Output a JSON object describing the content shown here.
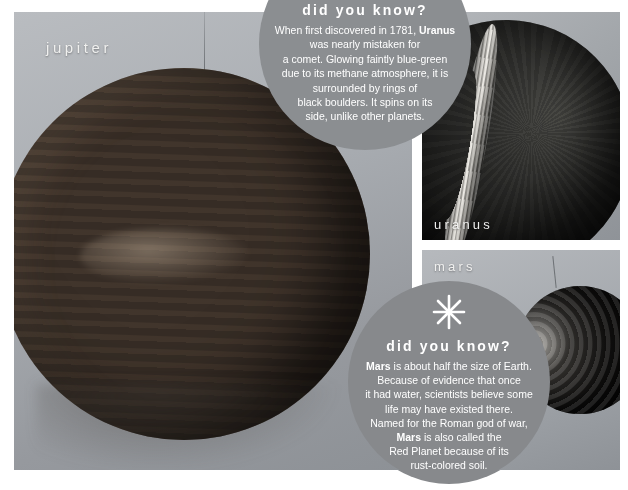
{
  "page": {
    "background_color": "#ffffff"
  },
  "panels": [
    {
      "id": "jupiter",
      "caption": "jupiter",
      "subject": "jupiter-planet-model"
    },
    {
      "id": "uranus",
      "caption": "uranus",
      "subject": "uranus-planet-model"
    },
    {
      "id": "mars",
      "caption": "mars",
      "subject": "mars-planet-model"
    }
  ],
  "bubbles": [
    {
      "id": "uranus",
      "title": "did you know?",
      "color": "#8b8e91",
      "lines": [
        "When first discovered in 1781, Uranus",
        "was nearly mistaken for",
        "a comet. Glowing faintly blue-green",
        "due to its methane atmosphere, it is",
        "surrounded by rings of",
        "black boulders. It spins on its",
        "side, unlike other planets."
      ],
      "bold_terms": [
        "Uranus"
      ]
    },
    {
      "id": "mars",
      "title": "did you know?",
      "color": "#87898c",
      "icon": "starburst-icon",
      "lines": [
        "Mars is about half the size of Earth.",
        "Because of evidence that once",
        "it had water, scientists believe some",
        "life may have existed there.",
        "Named for the Roman god of war,",
        "Mars is also called the",
        "Red Planet because of its",
        "rust-colored soil."
      ],
      "bold_terms": [
        "Mars"
      ]
    }
  ],
  "colors": {
    "bubble_gray": "#8a8d90",
    "caption_white": "#f0f0ef",
    "panel_backdrop": "#a4a8ad"
  }
}
